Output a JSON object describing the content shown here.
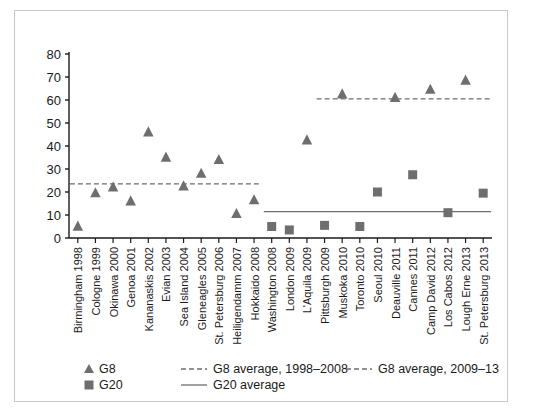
{
  "chart_data": {
    "type": "scatter",
    "title": "",
    "xlabel": "",
    "ylabel": "",
    "ylim": [
      0,
      80
    ],
    "yticks": [
      0,
      10,
      20,
      30,
      40,
      50,
      60,
      70,
      80
    ],
    "grid": false,
    "legend_position": "bottom-left",
    "categories": [
      "Birmingham 1998",
      "Cologne 1999",
      "Okinawa 2000",
      "Genoa 2001",
      "Kananaskis 2002",
      "Evian 2003",
      "Sea Island 2004",
      "Gleneagles 2005",
      "St. Petersburg 2006",
      "Heiligendamm 2007",
      "Hokkaido 2008",
      "Washington 2008",
      "London 2009",
      "L'Aquila 2009",
      "Pittsburgh 2009",
      "Muskoka 2010",
      "Toronto 2010",
      "Seoul 2010",
      "Deauville 2011",
      "Cannes 2011",
      "Camp David 2012",
      "Los Cabos 2012",
      "Lough Erne 2013",
      "St. Petersburg 2013"
    ],
    "series": [
      {
        "name": "G8",
        "marker": "triangle",
        "color": "#6e6e6e",
        "points": [
          {
            "category": "Birmingham 1998",
            "value": 5
          },
          {
            "category": "Cologne 1999",
            "value": 19.5
          },
          {
            "category": "Okinawa 2000",
            "value": 22
          },
          {
            "category": "Genoa 2001",
            "value": 16
          },
          {
            "category": "Kananaskis 2002",
            "value": 46
          },
          {
            "category": "Evian 2003",
            "value": 35
          },
          {
            "category": "Sea Island 2004",
            "value": 22.5
          },
          {
            "category": "Gleneagles 2005",
            "value": 28
          },
          {
            "category": "St. Petersburg 2006",
            "value": 34
          },
          {
            "category": "Heiligendamm 2007",
            "value": 10.5
          },
          {
            "category": "Hokkaido 2008",
            "value": 16.5
          },
          {
            "category": "L'Aquila 2009",
            "value": 42.5
          },
          {
            "category": "Muskoka 2010",
            "value": 62.5
          },
          {
            "category": "Deauville 2011",
            "value": 61
          },
          {
            "category": "Camp David 2012",
            "value": 64.5
          },
          {
            "category": "Lough Erne 2013",
            "value": 68.5
          }
        ]
      },
      {
        "name": "G20",
        "marker": "square",
        "color": "#6e6e6e",
        "points": [
          {
            "category": "Washington 2008",
            "value": 5
          },
          {
            "category": "London 2009",
            "value": 3.5
          },
          {
            "category": "Pittsburgh 2009",
            "value": 5.5
          },
          {
            "category": "Toronto 2010",
            "value": 5
          },
          {
            "category": "Seoul 2010",
            "value": 20
          },
          {
            "category": "Cannes 2011",
            "value": 27.5
          },
          {
            "category": "Los Cabos 2012",
            "value": 11
          },
          {
            "category": "St. Petersburg 2013",
            "value": 19.5
          }
        ]
      }
    ],
    "reference_lines": [
      {
        "name": "G8 average, 1998-2008",
        "value": 23.5,
        "style": "dashed",
        "color": "#6e6e6e",
        "from_category": "Birmingham 1998",
        "to_category": "Hokkaido 2008"
      },
      {
        "name": "G8 average, 2009-13",
        "value": 60.5,
        "style": "dashed",
        "color": "#6e6e6e",
        "from_category": "Pittsburgh 2009",
        "to_category": "St. Petersburg 2013"
      },
      {
        "name": "G20 average",
        "value": 11.5,
        "style": "solid",
        "color": "#6e6e6e",
        "from_category": "Washington 2008",
        "to_category": "St. Petersburg 2013"
      }
    ]
  },
  "legend": {
    "entries": [
      {
        "key": "g8",
        "label": "G8",
        "marker": "triangle"
      },
      {
        "key": "g20",
        "label": "G20",
        "marker": "square"
      },
      {
        "key": "g8avg1",
        "label": "G8 average, 1998–2008",
        "marker": "dashed-line"
      },
      {
        "key": "g8avg2",
        "label": "G8 average, 2009–13",
        "marker": "dashed-line"
      },
      {
        "key": "g20avg",
        "label": "G20 average",
        "marker": "solid-line"
      }
    ]
  },
  "colors": {
    "marker": "#6e6e6e",
    "axis": "#1a1a1a",
    "frame": "#c9c9c9",
    "background": "#ffffff"
  }
}
